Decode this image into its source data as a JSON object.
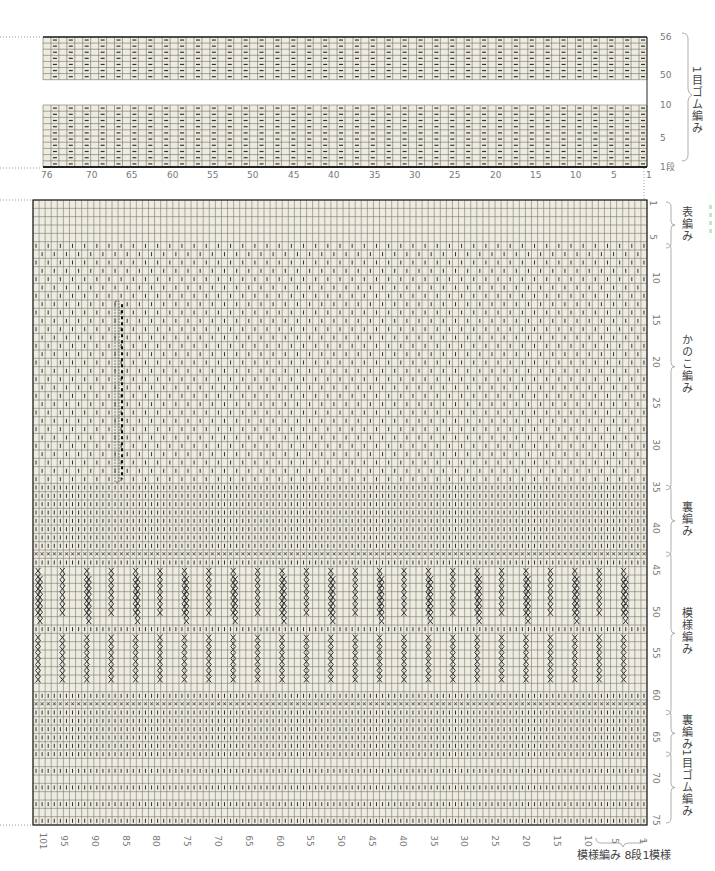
{
  "colors": {
    "paper": "#eeebe0",
    "grid": "#6f6f66",
    "border": "#222222",
    "symbol": "#333333",
    "label": "#777777",
    "dotted": "#999999",
    "accent_green": "#c9e6c2"
  },
  "top_chart": {
    "columns": 76,
    "col_labels": [
      "76",
      "70",
      "65",
      "60",
      "55",
      "50",
      "45",
      "40",
      "35",
      "30",
      "25",
      "20",
      "15",
      "10",
      "5",
      "1"
    ],
    "row_labels_upper": [
      "56",
      "50"
    ],
    "row_labels_lower": [
      "10",
      "5",
      "1段"
    ],
    "upper_rows": 7,
    "lower_rows": 10,
    "symbol": "purl-dash",
    "section_label": "1目ゴム編み"
  },
  "main_chart": {
    "columns": 101,
    "rows": 75,
    "col_labels": [
      "101",
      "95",
      "90",
      "85",
      "80",
      "75",
      "70",
      "65",
      "60",
      "55",
      "50",
      "45",
      "40",
      "35",
      "30",
      "25",
      "20",
      "15",
      "10",
      "5",
      "1"
    ],
    "row_labels": [
      "1",
      "5",
      "10",
      "15",
      "20",
      "25",
      "30",
      "35",
      "40",
      "45",
      "50",
      "55",
      "60",
      "65",
      "70",
      "75"
    ],
    "sections": [
      {
        "label": "表編み",
        "from": 1,
        "to": 6
      },
      {
        "label": "かのこ編み",
        "from": 6,
        "to": 35
      },
      {
        "label": "裏編み",
        "from": 35,
        "to": 43
      },
      {
        "label": "模様編み",
        "from": 43,
        "to": 62
      },
      {
        "label": "裏編み",
        "from": 62,
        "to": 67
      },
      {
        "label": "1目ゴム編み",
        "from": 67,
        "to": 75
      }
    ],
    "footer_caption": "模様編み 8段1模様"
  },
  "chart_data": {
    "type": "table",
    "charts": [
      {
        "name": "1目ゴム編み (1x1 rib)",
        "columns": 76,
        "rows_shown": [
          "1-10",
          "50-56"
        ],
        "x_ticks": [
          76,
          70,
          65,
          60,
          55,
          50,
          45,
          40,
          35,
          30,
          25,
          20,
          15,
          10,
          5,
          1
        ],
        "y_ticks": [
          1,
          5,
          10,
          50,
          56
        ]
      },
      {
        "name": "Main body chart",
        "columns": 101,
        "rows": 75,
        "x_ticks": [
          101,
          95,
          90,
          85,
          80,
          75,
          70,
          65,
          60,
          55,
          50,
          45,
          40,
          35,
          30,
          25,
          20,
          15,
          10,
          5,
          1
        ],
        "y_ticks": [
          1,
          5,
          10,
          15,
          20,
          25,
          30,
          35,
          40,
          45,
          50,
          55,
          60,
          65,
          70,
          75
        ],
        "sections": [
          "表編み 1-5",
          "かのこ編み 6-34",
          "裏編み 35-42",
          "模様編み 43-61",
          "裏編み 62-66",
          "1目ゴム編み 67-75"
        ],
        "repeat_note": "模様編み 8段1模様"
      }
    ]
  }
}
